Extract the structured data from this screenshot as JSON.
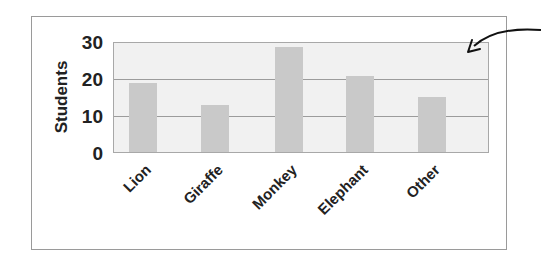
{
  "chart_data": {
    "type": "bar",
    "title": "",
    "xlabel": "",
    "ylabel": "Students",
    "categories": [
      "Lion",
      "Giraffe",
      "Monkey",
      "Elephant",
      "Other"
    ],
    "values": [
      19,
      13,
      29,
      21,
      15
    ],
    "ylim": [
      0,
      30
    ],
    "yticks": [
      "0",
      "10",
      "20",
      "30"
    ],
    "grid": true,
    "legend": null,
    "annotations": [
      "arrow pointing into upper-right area of the plot"
    ],
    "colors": {
      "bar": "#c9c9c9",
      "plot_bg": "#f1f1f1",
      "grid": "#9c9c9c",
      "frame": "#9a9a9a"
    }
  }
}
